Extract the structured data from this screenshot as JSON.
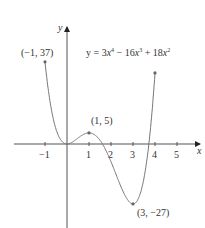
{
  "chart_data": {
    "type": "line",
    "equation": {
      "prefix": "y = 3",
      "x1": "x",
      "e1": "4",
      "mid1": " − 16",
      "x2": "x",
      "e2": "3",
      "mid2": " + 18",
      "x3": "x",
      "e3": "2"
    },
    "xlabel": "x",
    "ylabel": "y",
    "x_ticks": [
      "−1",
      "1",
      "2",
      "3",
      "4",
      "5"
    ],
    "x_tick_values": [
      -1,
      1,
      2,
      3,
      4,
      5
    ],
    "xlim": [
      -1.8,
      6
    ],
    "ylim": [
      -35,
      52
    ],
    "grid": false,
    "domain": [
      -1,
      4
    ],
    "annotations": [
      {
        "label": "(−1, 37)",
        "x": -1,
        "y": 37
      },
      {
        "label": "(1, 5)",
        "x": 1,
        "y": 5
      },
      {
        "label": "(3, −27)",
        "x": 3,
        "y": -27
      }
    ],
    "endpoint_right": {
      "x": 4,
      "y": 32
    },
    "series": [
      {
        "name": "y = 3x^4 - 16x^3 + 18x^2",
        "x": [
          -1,
          -0.5,
          0,
          0.5,
          1,
          1.5,
          2,
          2.5,
          3,
          3.5,
          4
        ],
        "values": [
          37,
          6.69,
          0,
          2.69,
          5,
          0.19,
          -8,
          -18.8,
          -27,
          -16.3,
          32
        ]
      }
    ]
  }
}
